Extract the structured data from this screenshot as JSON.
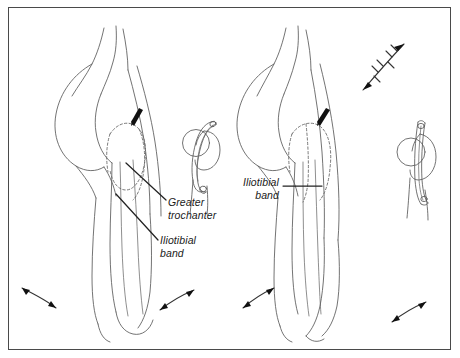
{
  "figure": {
    "background_color": "#ffffff",
    "border_color": "#4a4a4a",
    "line_color": "#555555",
    "accent_color": "#111111"
  },
  "labels": {
    "greater_trochanter": "Greater\ntrochanter",
    "iliotibial_band_left": "Iliotibial\nband",
    "iliotibial_band_right": "Iliotibial\nband"
  },
  "panels": [
    {
      "id": "left-panel",
      "name": "hip-flexed-view",
      "description": "Lateral view of hip and thigh with dashed greater trochanter outline and iliotibial band",
      "annotations": [
        "greater_trochanter",
        "iliotibial_band_left"
      ],
      "inset": {
        "name": "trochanter-band-inset-left",
        "description": "Cross section of greater trochanter with iliotibial band looping over it"
      },
      "motion_arrows": 2
    },
    {
      "id": "right-panel",
      "name": "hip-extended-view",
      "description": "Lateral view of hip and thigh in extension with dashed greater trochanter outline and straightened iliotibial band",
      "annotations": [
        "iliotibial_band_right"
      ],
      "inset": {
        "name": "trochanter-band-inset-right",
        "description": "Cross section of greater trochanter with iliotibial band drawn taut over it"
      },
      "motion_arrows": 3
    }
  ],
  "markers": {
    "trochanter_pointer_count": 2,
    "pointer_description": "small solid arrow indicating greater trochanter prominence"
  }
}
